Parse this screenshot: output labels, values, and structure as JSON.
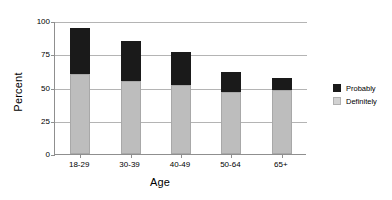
{
  "chart_data": {
    "type": "bar",
    "stacked": true,
    "title": "",
    "xlabel": "Age",
    "ylabel": "Percent",
    "categories": [
      "18-29",
      "30-39",
      "40-49",
      "50-64",
      "65+"
    ],
    "series": [
      {
        "name": "Definitely",
        "color": "#bdbdbd",
        "values": [
          60,
          55,
          52,
          47,
          48
        ]
      },
      {
        "name": "Probably",
        "color": "#1a1a1a",
        "values": [
          35,
          30,
          25,
          15,
          9
        ]
      }
    ],
    "totals": [
      95,
      85,
      77,
      62,
      57
    ],
    "ylim": [
      0,
      100
    ],
    "yticks": [
      0,
      25,
      50,
      75,
      100
    ],
    "ytick_labels": [
      "0",
      "25",
      "50",
      "75",
      "100"
    ],
    "grid": true,
    "grid_axis": "y",
    "legend_position": "right",
    "legend_entries": [
      "Probably",
      "Definitely"
    ]
  },
  "axes": {
    "y_title": "Percent",
    "x_title": "Age"
  },
  "legend": {
    "items": [
      {
        "label": "Probably",
        "swatch": "probably"
      },
      {
        "label": "Definitely",
        "swatch": "definitely"
      }
    ]
  }
}
